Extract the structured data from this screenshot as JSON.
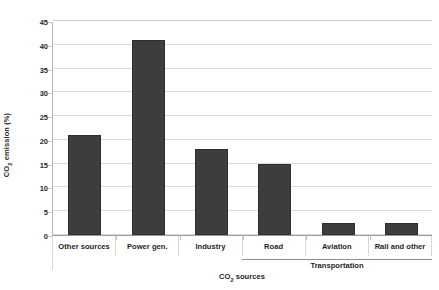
{
  "chart_data": {
    "type": "bar",
    "title": "",
    "subtitle": "",
    "xlabel": "CO₂ sources",
    "xlabel_parts": {
      "pre": "CO",
      "sub": "2",
      "post": " sources"
    },
    "ylabel": "CO₂ emission (%)",
    "ylabel_parts": {
      "pre": "CO",
      "sub": "2",
      "post": " emission (%)"
    },
    "categories": [
      "Other sources",
      "Power gen.",
      "Industry",
      "Road",
      "Aviation",
      "Rail and other"
    ],
    "values": [
      21,
      41,
      18,
      15,
      2.5,
      2.5
    ],
    "ylim": [
      0,
      45
    ],
    "ytick_step": 5,
    "yticks": [
      0,
      5,
      10,
      15,
      20,
      25,
      30,
      35,
      40,
      45
    ],
    "ytick_labels": [
      "0",
      "5",
      "10",
      "15",
      "20",
      "25",
      "30",
      "35",
      "40",
      "45"
    ],
    "grid": true,
    "grid_axis": "y",
    "legend": false,
    "legend_position": "none",
    "bar_color": "#3d3d3d",
    "grid_color": "#dcdcdc",
    "groups": [
      {
        "label": "Transportation",
        "category_indices": [
          3,
          4,
          5
        ]
      }
    ]
  }
}
